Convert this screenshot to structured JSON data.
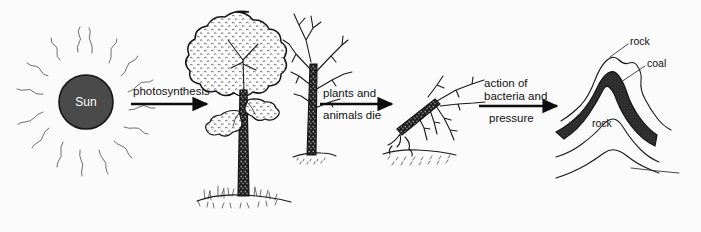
{
  "diagram": {
    "background_color": "#fbfbfb",
    "ink_color": "#1a1a1a",
    "sun_fill_color": "#4a4a4a",
    "coal_fill_color": "#2b2b2b"
  },
  "sun": {
    "label": "Sun",
    "ray_count": 16
  },
  "arrows": [
    {
      "id": "photosynthesis",
      "lines": [
        "photosynthesis"
      ],
      "label_position": "above"
    },
    {
      "id": "plants-and-animals-die",
      "lines": [
        "plants and",
        "animals die"
      ],
      "label_position": "split"
    },
    {
      "id": "action-of-bacteria-and-pressure",
      "lines": [
        "action of",
        "bacteria and",
        "pressure"
      ],
      "label_position": "split"
    }
  ],
  "stages": [
    {
      "id": "sun",
      "name": "Sun"
    },
    {
      "id": "living-tree",
      "name": "Living leafy tree"
    },
    {
      "id": "bare-tree",
      "name": "Bare dying tree"
    },
    {
      "id": "fallen-tree",
      "name": "Fallen dead tree"
    },
    {
      "id": "strata",
      "name": "Rock strata with coal seam"
    }
  ],
  "strata_labels": [
    {
      "id": "rock-top",
      "text": "rock"
    },
    {
      "id": "coal",
      "text": "coal"
    },
    {
      "id": "rock-lower",
      "text": "rock"
    }
  ]
}
